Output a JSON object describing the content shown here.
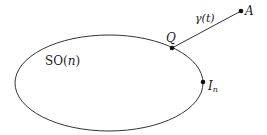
{
  "diagram": {
    "set_label": "SO(n)",
    "set_label_parts": {
      "prefix": "SO(",
      "var": "n",
      "suffix": ")"
    },
    "curve_label": "γ(t)",
    "curve_label_parts": {
      "func": "γ(",
      "var": "t",
      "suffix": ")"
    },
    "points": [
      {
        "id": "Q",
        "label": "Q",
        "x": 172,
        "y": 48
      },
      {
        "id": "A",
        "label": "A",
        "x": 241,
        "y": 11
      },
      {
        "id": "In",
        "label": "I",
        "subscript": "n",
        "x": 203,
        "y": 82
      }
    ],
    "ellipse": {
      "cx": 109,
      "cy": 83,
      "rx": 94,
      "ry": 48
    },
    "colors": {
      "stroke": "#333333",
      "point": "#111111",
      "background": "#ffffff"
    }
  }
}
